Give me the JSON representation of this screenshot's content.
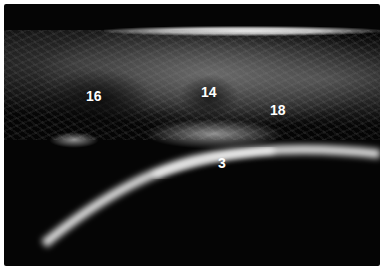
{
  "image": {
    "type": "ultrasound",
    "labels": [
      {
        "text": "16",
        "x": 86,
        "y": 92
      },
      {
        "text": "14",
        "x": 201,
        "y": 88
      },
      {
        "text": "18",
        "x": 270,
        "y": 106
      },
      {
        "text": "3",
        "x": 218,
        "y": 158
      }
    ]
  }
}
